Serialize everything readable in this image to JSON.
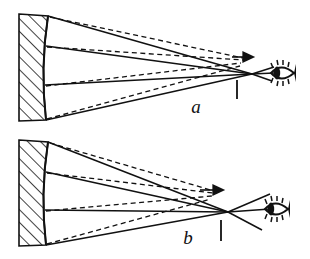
{
  "figure": {
    "background_color": "#ffffff",
    "ink_color": "#111111",
    "width": 310,
    "height": 259
  },
  "panels": [
    {
      "id": "a",
      "label": "a",
      "label_x": 196,
      "label_y": 113,
      "caption": "Rays reflected from concave mirror converging at the eye's position",
      "mirror": {
        "name": "concave-mirror",
        "hatched": true,
        "back_x": 19,
        "front_top_x": 48,
        "front_bottom_x": 46,
        "top_y": 14,
        "bottom_y": 121,
        "hatch_count": 7
      },
      "convergence_point": {
        "x": 252,
        "y": 74
      },
      "tick_mark": {
        "x": 237,
        "y_top": 79,
        "y_bottom": 98
      },
      "virtual_arrow": {
        "x": 240,
        "y": 57,
        "direction": "right"
      },
      "eye": {
        "x": 283,
        "y": 73,
        "facing": "left"
      },
      "solid_rays": [
        {
          "from_x": 48,
          "from_y": 16,
          "to_x": 252,
          "to_y": 74
        },
        {
          "from_x": 46,
          "from_y": 46,
          "to_x": 252,
          "to_y": 74
        },
        {
          "from_x": 45,
          "from_y": 85,
          "to_x": 252,
          "to_y": 74
        },
        {
          "from_x": 46,
          "from_y": 120,
          "to_x": 252,
          "to_y": 74
        }
      ],
      "dashed_rays": [
        {
          "from_x": 50,
          "from_y": 17,
          "to_x": 243,
          "to_y": 58
        },
        {
          "from_x": 47,
          "from_y": 47,
          "to_x": 243,
          "to_y": 60
        },
        {
          "from_x": 46,
          "from_y": 86,
          "to_x": 241,
          "to_y": 63
        },
        {
          "from_x": 47,
          "from_y": 119,
          "to_x": 240,
          "to_y": 66
        }
      ],
      "exit_rays": [
        {
          "from_x": 252,
          "from_y": 74,
          "to_x": 272,
          "to_y": 68
        },
        {
          "from_x": 252,
          "from_y": 74,
          "to_x": 272,
          "to_y": 73
        },
        {
          "from_x": 252,
          "from_y": 74,
          "to_x": 272,
          "to_y": 80
        }
      ]
    },
    {
      "id": "b",
      "label": "b",
      "label_x": 188,
      "label_y": 244,
      "caption": "Rays crossing before the eye and diverging past the focus",
      "mirror": {
        "name": "concave-mirror",
        "hatched": true,
        "back_x": 19,
        "front_top_x": 48,
        "front_bottom_x": 46,
        "top_y": 140,
        "bottom_y": 246,
        "hatch_count": 7
      },
      "convergence_point": {
        "x": 228,
        "y": 212
      },
      "tick_mark": {
        "x": 221,
        "y_top": 219,
        "y_bottom": 240
      },
      "virtual_arrow": {
        "x": 211,
        "y": 190,
        "direction": "right"
      },
      "eye": {
        "x": 277,
        "y": 209,
        "facing": "left"
      },
      "solid_rays": [
        {
          "from_x": 48,
          "from_y": 142,
          "to_x": 228,
          "to_y": 212
        },
        {
          "from_x": 46,
          "from_y": 172,
          "to_x": 228,
          "to_y": 212
        },
        {
          "from_x": 45,
          "from_y": 210,
          "to_x": 228,
          "to_y": 212
        },
        {
          "from_x": 46,
          "from_y": 245,
          "to_x": 228,
          "to_y": 212
        }
      ],
      "dashed_rays": [
        {
          "from_x": 50,
          "from_y": 143,
          "to_x": 214,
          "to_y": 191
        },
        {
          "from_x": 47,
          "from_y": 173,
          "to_x": 213,
          "to_y": 193
        },
        {
          "from_x": 46,
          "from_y": 211,
          "to_x": 212,
          "to_y": 196
        },
        {
          "from_x": 47,
          "from_y": 244,
          "to_x": 211,
          "to_y": 199
        }
      ],
      "exit_rays": [
        {
          "from_x": 228,
          "from_y": 212,
          "to_x": 268,
          "to_y": 195
        },
        {
          "from_x": 228,
          "from_y": 212,
          "to_x": 268,
          "to_y": 209
        },
        {
          "from_x": 228,
          "from_y": 212,
          "to_x": 262,
          "to_y": 228
        }
      ]
    }
  ]
}
